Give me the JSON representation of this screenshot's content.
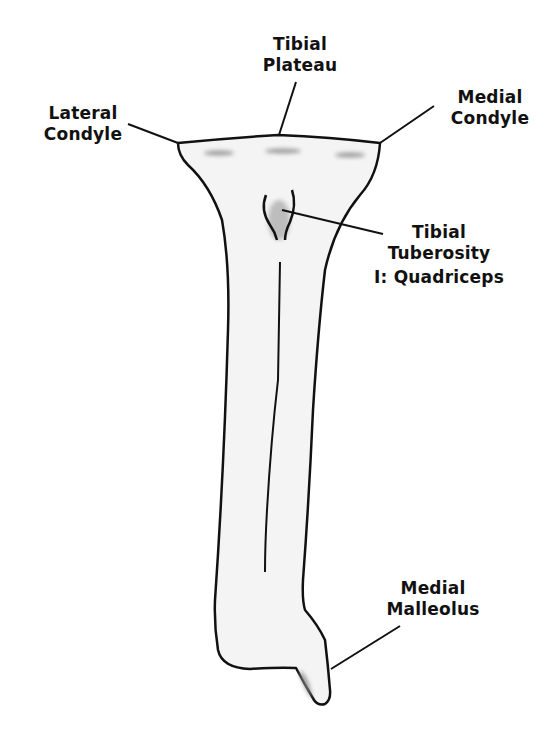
{
  "diagram": {
    "colors": {
      "background": "#ffffff",
      "outline": "#111111",
      "bone_fill": "#f4f4f4",
      "shading": "#b8b8b8",
      "text": "#111111"
    },
    "labels": {
      "tibial_plateau": {
        "line1": "Tibial",
        "line2": "Plateau"
      },
      "lateral_condyle": {
        "line1": "Lateral",
        "line2": "Condyle"
      },
      "medial_condyle": {
        "line1": "Medial",
        "line2": "Condyle"
      },
      "tibial_tuberosity": {
        "line1": "Tibial",
        "line2": "Tuberosity",
        "line3": "I: Quadriceps"
      },
      "medial_malleolus": {
        "line1": "Medial",
        "line2": "Malleolus"
      }
    }
  }
}
